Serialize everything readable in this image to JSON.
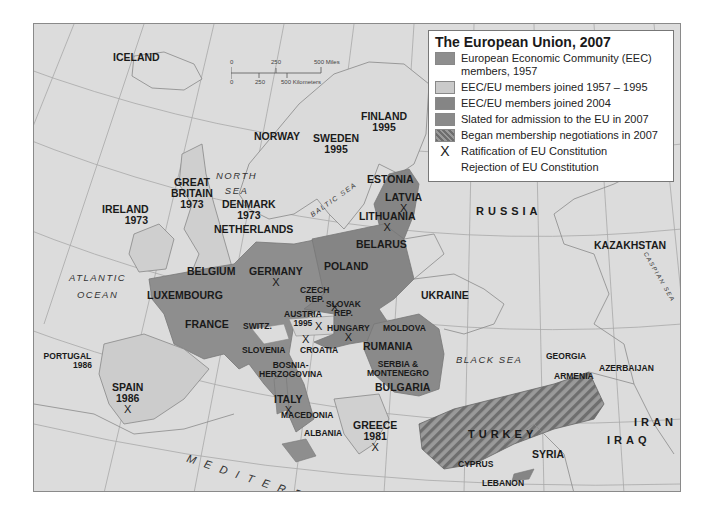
{
  "legend": {
    "title": "The European Union, 2007",
    "items": [
      {
        "label": "European Economic Community (EEC) members, 1957",
        "swatch": "#8e8e8e",
        "type": "fill"
      },
      {
        "label": "EEC/EU members joined 1957 – 1995",
        "swatch": "#cacaca",
        "type": "fill"
      },
      {
        "label": "EEC/EU members joined 2004",
        "swatch": "#858585",
        "type": "fill"
      },
      {
        "label": "Slated for admission to the EU in 2007",
        "swatch": "#8a8a8a",
        "type": "fill"
      },
      {
        "label": "Began membership negotiations in 2007",
        "swatch": "#7d7d7d",
        "type": "hatch"
      },
      {
        "label": "Ratification of EU Constitution",
        "symbol": "X",
        "type": "symbol"
      },
      {
        "label": "Rejection of EU Constitution",
        "symbol": "",
        "type": "symbol"
      }
    ]
  },
  "scale": {
    "miles": [
      "0",
      "250",
      "500 Miles"
    ],
    "km": [
      "0",
      "250",
      "500 Kilometers"
    ]
  },
  "colors": {
    "background": "#dcdcdc",
    "eec_1957": "#8e8e8e",
    "joined_1957_1995": "#cacaca",
    "joined_2004": "#858585",
    "slated_2007": "#8a8a8a",
    "negotiations_2007": "#7d7d7d",
    "border": "#8a8a8a"
  },
  "countries": {
    "iceland": "ICELAND",
    "finland": "FINLAND",
    "finland_year": "1995",
    "norway": "NORWAY",
    "sweden": "SWEDEN",
    "sweden_year": "1995",
    "estonia": "ESTONIA",
    "latvia": "LATVIA",
    "lithuania": "LITHUANIA",
    "russia": "RUSSIA",
    "great_britain_1": "GREAT",
    "great_britain_2": "BRITAIN",
    "great_britain_year": "1973",
    "ireland": "IRELAND",
    "ireland_year": "1973",
    "denmark": "DENMARK",
    "denmark_year": "1973",
    "netherlands": "NETHERLANDS",
    "belarus": "BELARUS",
    "kazakhstan": "KAZAKHSTAN",
    "belgium": "BELGIUM",
    "germany": "GERMANY",
    "poland": "POLAND",
    "luxembourg": "LUXEMBOURG",
    "czech_1": "CZECH",
    "czech_2": "REP.",
    "slovak_1": "SLOVAK",
    "slovak_2": "REP.",
    "ukraine": "UKRAINE",
    "france": "FRANCE",
    "switz": "SWITZ.",
    "austria": "AUSTRIA",
    "austria_year": "1995",
    "hungary": "HUNGARY",
    "moldova": "MOLDOVA",
    "slovenia": "SLOVENIA",
    "croatia": "CROATIA",
    "rumania": "RUMANIA",
    "portugal": "PORTUGAL",
    "portugal_year": "1986",
    "bosnia_1": "BOSNIA-",
    "bosnia_2": "HERZOGOVINA",
    "serbia_1": "SERBIA &",
    "serbia_2": "MONTENEGRO",
    "georgia": "GEORGIA",
    "armenia": "ARMENIA",
    "azerbaijan": "AZERBAIJAN",
    "spain": "SPAIN",
    "spain_year": "1986",
    "italy": "ITALY",
    "bulgaria": "BULGARIA",
    "turkey": "TURKEY",
    "iran": "IRAN",
    "macedonia": "MACEDONIA",
    "albania": "ALBANIA",
    "greece": "GREECE",
    "greece_year": "1981",
    "syria": "SYRIA",
    "iraq": "IRAQ",
    "cyprus": "CYPRUS",
    "lebanon": "LEBANON"
  },
  "seas": {
    "north_1": "NORTH",
    "north_2": "SEA",
    "baltic": "BALTIC SEA",
    "atlantic_1": "ATLANTIC",
    "atlantic_2": "OCEAN",
    "black": "BLACK SEA",
    "caspian": "CASPIAN SEA",
    "mediterranean": "MEDITERRANEAN SEA"
  },
  "ratification_marker": "X"
}
